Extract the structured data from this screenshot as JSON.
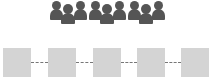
{
  "diagram": {
    "type": "people-groups-over-node-chain",
    "groups": [
      {
        "label": "",
        "icon": "people-group-icon",
        "members": 3
      },
      {
        "label": "",
        "icon": "people-group-icon",
        "members": 3
      },
      {
        "label": "",
        "icon": "people-group-icon",
        "members": 3
      }
    ],
    "nodes": [
      {
        "label": ""
      },
      {
        "label": ""
      },
      {
        "label": ""
      },
      {
        "label": ""
      },
      {
        "label": ""
      }
    ],
    "edges": [
      {
        "from": 0,
        "to": 1,
        "style": "dotted"
      },
      {
        "from": 1,
        "to": 2,
        "style": "dotted"
      },
      {
        "from": 2,
        "to": 3,
        "style": "dotted"
      },
      {
        "from": 3,
        "to": 4,
        "style": "dotted"
      }
    ],
    "colors": {
      "people": "#555555",
      "node_fill": "#d4d4d4",
      "edge": "#777777"
    }
  }
}
